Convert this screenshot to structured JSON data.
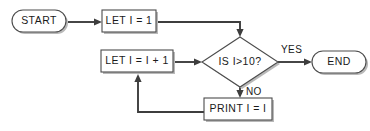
{
  "diagram": {
    "colors": {
      "background": "#ffffff",
      "node_stroke": "#4c4c4c",
      "node_fill": "#ffffff",
      "node_shadow": "#b9b9b9",
      "edge": "#3d3d3d",
      "text": "#1a1a1a"
    },
    "nodes": {
      "start": {
        "label": "START",
        "shape": "terminator"
      },
      "init": {
        "label": "LET I = 1",
        "shape": "process"
      },
      "increment": {
        "label": "LET I = I + 1",
        "shape": "process"
      },
      "decision": {
        "label": "IS I>10?",
        "shape": "decision"
      },
      "print": {
        "label": "PRINT I = I",
        "shape": "process"
      },
      "end": {
        "label": "END",
        "shape": "terminator"
      }
    },
    "edge_labels": {
      "yes": "YES",
      "no": "NO"
    }
  }
}
